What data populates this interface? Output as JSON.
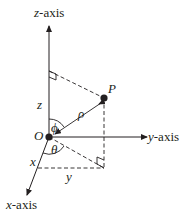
{
  "diagram": {
    "axes": {
      "z": {
        "prefix": "z",
        "suffix": "-axis"
      },
      "y": {
        "prefix": "y",
        "suffix": "-axis"
      },
      "x": {
        "prefix": "x",
        "suffix": "-axis"
      }
    },
    "labels": {
      "origin": "O",
      "point": "P",
      "rho": "ρ",
      "phi": "ϕ",
      "theta": "θ",
      "z": "z",
      "x": "x",
      "y": "y"
    },
    "colors": {
      "ink": "#231f20",
      "background": "#ffffff"
    }
  }
}
